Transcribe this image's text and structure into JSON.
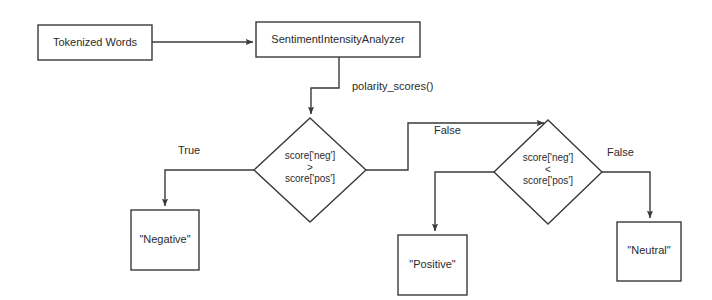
{
  "diagram": {
    "type": "flowchart",
    "nodes": [
      {
        "id": "tokenized-words",
        "shape": "rectangle",
        "label": "Tokenized Words",
        "x": 38,
        "y": 25,
        "width": 114,
        "height": 35
      },
      {
        "id": "sentiment-intensity-analyzer",
        "shape": "rectangle",
        "label": "SentimentIntensityAnalyzer",
        "x": 256,
        "y": 22,
        "width": 164,
        "height": 35
      },
      {
        "id": "decision-neg-gt-pos",
        "shape": "diamond",
        "label_line1": "score['neg']",
        "label_op": ">",
        "label_line2": "score['pos']",
        "cx": 310,
        "cy": 170,
        "rx": 56,
        "ry": 52
      },
      {
        "id": "decision-neg-lt-pos",
        "shape": "diamond",
        "label_line1": "score['neg']",
        "label_op": "<",
        "label_line2": "score['pos']",
        "cx": 548,
        "cy": 172,
        "rx": 54,
        "ry": 52
      },
      {
        "id": "result-negative",
        "shape": "rectangle",
        "label": "\"Negative\"",
        "x": 131,
        "y": 210,
        "width": 68,
        "height": 60
      },
      {
        "id": "result-positive",
        "shape": "rectangle",
        "label": "\"Positive\"",
        "x": 398,
        "y": 235,
        "width": 69,
        "height": 60
      },
      {
        "id": "result-neutral",
        "shape": "rectangle",
        "label": "\"Neutral\"",
        "x": 617,
        "y": 222,
        "width": 64,
        "height": 59
      }
    ],
    "edges": [
      {
        "id": "edge-tokens-to-analyzer",
        "from": "tokenized-words",
        "to": "sentiment-intensity-analyzer",
        "label": ""
      },
      {
        "id": "edge-analyzer-to-decision1",
        "from": "sentiment-intensity-analyzer",
        "to": "decision-neg-gt-pos",
        "label": "polarity_scores()"
      },
      {
        "id": "edge-decision1-true",
        "from": "decision-neg-gt-pos",
        "to": "result-negative",
        "label": "True"
      },
      {
        "id": "edge-decision1-false",
        "from": "decision-neg-gt-pos",
        "to": "decision-neg-lt-pos",
        "label": "False"
      },
      {
        "id": "edge-decision2-true",
        "from": "decision-neg-lt-pos",
        "to": "result-positive",
        "label": ""
      },
      {
        "id": "edge-decision2-false",
        "from": "decision-neg-lt-pos",
        "to": "result-neutral",
        "label": "False"
      }
    ],
    "edge_labels": {
      "polarity_scores": "polarity_scores()",
      "true_left": "True",
      "false_middle": "False",
      "false_right": "False"
    },
    "colors": {
      "stroke": "#3a3a3a",
      "text": "#2b2b2b",
      "background": "#ffffff",
      "node_fill": "#ffffff"
    }
  }
}
